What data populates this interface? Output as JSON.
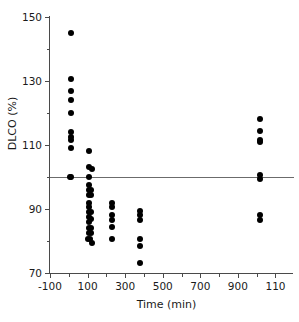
{
  "chart_data": {
    "type": "scatter",
    "title": "",
    "xlabel": "Time (min)",
    "ylabel": "DLCO (%)",
    "xlim": [
      -100,
      1140
    ],
    "ylim": [
      70,
      150
    ],
    "grid": false,
    "legend": null,
    "xticks": [
      -100,
      100,
      300,
      500,
      700,
      900,
      1100
    ],
    "xtick_labels": [
      "-100",
      "100",
      "300",
      "500",
      "700",
      "900",
      "110"
    ],
    "xminor_ticks": [
      0,
      200,
      400,
      600,
      800,
      1000
    ],
    "yticks": [
      70,
      90,
      110,
      130,
      150
    ],
    "ytick_labels": [
      "70",
      "90",
      "110",
      "130",
      "150"
    ],
    "yminor_ticks": [
      80,
      100,
      120,
      140
    ],
    "reference_line": {
      "orientation": "horizontal",
      "y": 100,
      "label": "100% predicted"
    },
    "marker": {
      "shape": "circle",
      "color": "#000000",
      "size_px": 6
    },
    "series": [
      {
        "name": "DLCO measurements",
        "color": "#000000",
        "points": [
          {
            "x": 10,
            "y": 145
          },
          {
            "x": 10,
            "y": 130.5
          },
          {
            "x": 10,
            "y": 127
          },
          {
            "x": 10,
            "y": 124
          },
          {
            "x": 10,
            "y": 120
          },
          {
            "x": 10,
            "y": 114
          },
          {
            "x": 10,
            "y": 112.5
          },
          {
            "x": 10,
            "y": 111.5
          },
          {
            "x": 10,
            "y": 109
          },
          {
            "x": 5,
            "y": 100
          },
          {
            "x": 14,
            "y": 100
          },
          {
            "x": 108,
            "y": 108
          },
          {
            "x": 105,
            "y": 103
          },
          {
            "x": 122,
            "y": 102.5
          },
          {
            "x": 105,
            "y": 100
          },
          {
            "x": 105,
            "y": 97.5
          },
          {
            "x": 105,
            "y": 96
          },
          {
            "x": 120,
            "y": 96
          },
          {
            "x": 105,
            "y": 94.5
          },
          {
            "x": 120,
            "y": 94.5
          },
          {
            "x": 105,
            "y": 92
          },
          {
            "x": 105,
            "y": 90.5
          },
          {
            "x": 105,
            "y": 89
          },
          {
            "x": 120,
            "y": 89
          },
          {
            "x": 105,
            "y": 87.5
          },
          {
            "x": 120,
            "y": 87
          },
          {
            "x": 105,
            "y": 86
          },
          {
            "x": 105,
            "y": 84
          },
          {
            "x": 120,
            "y": 84
          },
          {
            "x": 105,
            "y": 82.5
          },
          {
            "x": 120,
            "y": 82.5
          },
          {
            "x": 103,
            "y": 80.5
          },
          {
            "x": 113,
            "y": 80.5
          },
          {
            "x": 122,
            "y": 79.5
          },
          {
            "x": 230,
            "y": 92
          },
          {
            "x": 230,
            "y": 90.5
          },
          {
            "x": 230,
            "y": 88
          },
          {
            "x": 230,
            "y": 86.5
          },
          {
            "x": 230,
            "y": 84.5
          },
          {
            "x": 230,
            "y": 80.5
          },
          {
            "x": 378,
            "y": 89.5
          },
          {
            "x": 378,
            "y": 88
          },
          {
            "x": 378,
            "y": 86.5
          },
          {
            "x": 378,
            "y": 80.5
          },
          {
            "x": 378,
            "y": 78.5
          },
          {
            "x": 378,
            "y": 73
          },
          {
            "x": 1020,
            "y": 118
          },
          {
            "x": 1020,
            "y": 114.5
          },
          {
            "x": 1020,
            "y": 111.5
          },
          {
            "x": 1020,
            "y": 111
          },
          {
            "x": 1020,
            "y": 100.5
          },
          {
            "x": 1020,
            "y": 99.5
          },
          {
            "x": 1020,
            "y": 88
          },
          {
            "x": 1020,
            "y": 86.5
          }
        ]
      }
    ]
  }
}
